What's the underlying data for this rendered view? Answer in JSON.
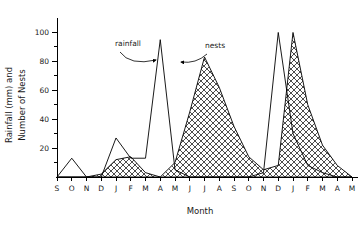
{
  "chart_data": {
    "type": "line",
    "title": "",
    "xlabel": "Month",
    "ylabel": "Rainfall (mm) and Number of Nests",
    "ylabel_line1": "Rainfall (mm) and",
    "ylabel_line2": "Number of Nests",
    "ylim": [
      0,
      110
    ],
    "yticks": [
      20,
      40,
      60,
      80,
      100
    ],
    "ytick_labels": [
      "20",
      "40",
      "60",
      "80",
      "100"
    ],
    "grid": false,
    "legend_position": "inline-annotations",
    "categories": [
      "S",
      "O",
      "N",
      "D",
      "J",
      "F",
      "M",
      "A",
      "M",
      "J",
      "J",
      "A",
      "S",
      "O",
      "N",
      "D",
      "J",
      "F",
      "M",
      "A",
      "M"
    ],
    "series": [
      {
        "name": "rainfall",
        "style": "line-unfilled",
        "values": [
          0,
          13,
          0,
          0,
          27,
          13,
          13,
          95,
          5,
          0,
          0,
          0,
          0,
          0,
          3,
          100,
          30,
          8,
          3,
          0,
          0
        ]
      },
      {
        "name": "nests",
        "style": "area-crosshatch",
        "values": [
          0,
          0,
          0,
          2,
          12,
          14,
          3,
          0,
          10,
          45,
          83,
          62,
          35,
          14,
          5,
          8,
          100,
          50,
          22,
          8,
          0
        ]
      }
    ],
    "annotations": [
      {
        "label": "rainfall",
        "x_month_index": 4,
        "points_to_index": 7
      },
      {
        "label": "nests",
        "x_month_index": 12,
        "points_to_index": 10
      }
    ],
    "colors": {
      "axis": "#000000",
      "rainfall_line": "#000000",
      "nests_fill": "#ffffff",
      "nests_hatch": "#000000",
      "background": "#ffffff"
    }
  }
}
